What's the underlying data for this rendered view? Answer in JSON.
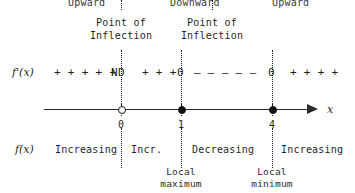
{
  "diagram": {
    "title_rows": {
      "concavity_label_row": "concavity",
      "inflection_label_row": "points of inflection",
      "derivative_row": "f'(x) sign row",
      "number_line_row": "x number line",
      "behavior_row": "f(x) behavior row",
      "extrema_row": "local extrema"
    },
    "concavity": [
      {
        "label": "Upward"
      },
      {
        "label": "Downward"
      },
      {
        "label": "Upward"
      }
    ],
    "inflection_points": [
      {
        "line1": "Point of",
        "line2": "Inflection"
      },
      {
        "line1": "Point of",
        "line2": "Inflection"
      }
    ],
    "derivative": {
      "label": "f'(x)",
      "segments": [
        {
          "signs": "+ + + + +"
        },
        {
          "signs": "+ + +"
        },
        {
          "signs": "– – – – –"
        },
        {
          "signs": "+ + + +"
        }
      ],
      "critical_markers": [
        {
          "value": "ND"
        },
        {
          "value": "0"
        },
        {
          "value": "0"
        }
      ]
    },
    "number_line": {
      "axis_variable": "x",
      "ticks": [
        {
          "label": "0",
          "marker": "open"
        },
        {
          "label": "1",
          "marker": "closed"
        },
        {
          "label": "4",
          "marker": "closed"
        }
      ]
    },
    "behavior": {
      "label": "f(x)",
      "segments": [
        {
          "text": "Increasing"
        },
        {
          "text": "Incr."
        },
        {
          "text": "Decreasing"
        },
        {
          "text": "Increasing"
        }
      ]
    },
    "extrema": [
      {
        "line1": "Local",
        "line2": "maximum"
      },
      {
        "line1": "Local",
        "line2": "minimum"
      }
    ],
    "colors": {
      "ink": "#1a1a1a",
      "line": "#2b2b2b",
      "background": "#ffffff"
    }
  }
}
